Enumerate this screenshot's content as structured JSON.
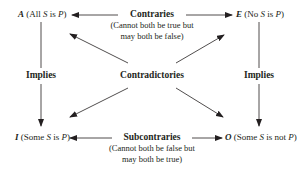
{
  "diagram": {
    "corners": {
      "A": {
        "letter": "A",
        "pre": " (All ",
        "s": "S",
        "mid": " is ",
        "p": "P",
        "post": ")"
      },
      "E": {
        "letter": "E",
        "pre": " (No ",
        "s": "S",
        "mid": " is ",
        "p": "P",
        "post": ")"
      },
      "I": {
        "letter": "I",
        "pre": " (Some ",
        "s": "S",
        "mid": " is ",
        "p": "P",
        "post": ")"
      },
      "O": {
        "letter": "O",
        "pre": " (Some ",
        "s": "S",
        "mid": " is not ",
        "p": "P",
        "post": ")"
      }
    },
    "relations": {
      "contraries": {
        "title": "Contraries",
        "line1": "(Cannot both be true but",
        "line2": "may both be false)"
      },
      "subcontraries": {
        "title": "Subcontraries",
        "line1": "(Cannot both be false but",
        "line2": "may both be true)"
      },
      "contradictories": {
        "title": "Contradictories"
      },
      "implies_left": {
        "title": "Implies"
      },
      "implies_right": {
        "title": "Implies"
      }
    },
    "colors": {
      "ink": "#231f20",
      "line": "#231f20"
    }
  }
}
